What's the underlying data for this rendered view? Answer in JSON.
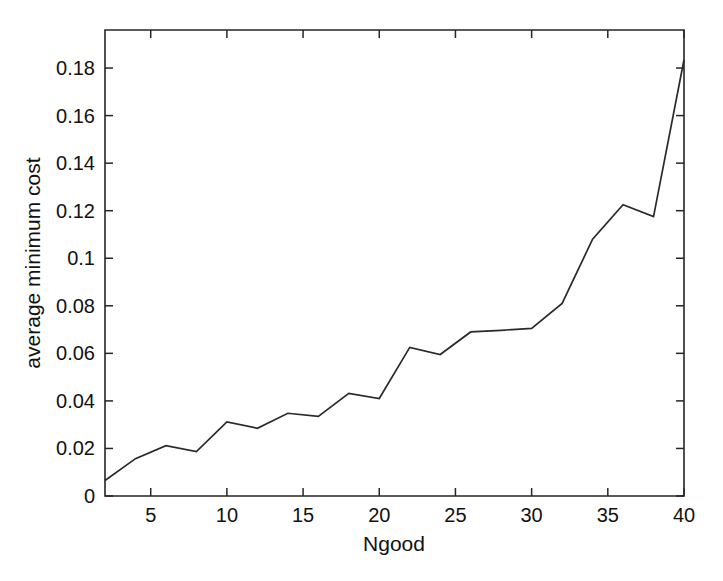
{
  "figure": {
    "background_color": "#ffffff",
    "line_color": "#2a2a2a",
    "axis_color": "#262626",
    "title": ""
  },
  "chart_data": {
    "type": "line",
    "title": "",
    "xlabel": "Ngood",
    "ylabel": "average minimum cost",
    "xlim": [
      2,
      40
    ],
    "ylim": [
      0,
      0.196
    ],
    "grid": false,
    "legend": null,
    "x_ticks": [
      5,
      10,
      15,
      20,
      25,
      30,
      35,
      40
    ],
    "x_tick_labels": [
      "5",
      "10",
      "15",
      "20",
      "25",
      "30",
      "35",
      "40"
    ],
    "y_ticks": [
      0,
      0.02,
      0.04,
      0.06,
      0.08,
      0.1,
      0.12,
      0.14,
      0.16,
      0.18
    ],
    "y_tick_labels": [
      "0",
      "0.02",
      "0.04",
      "0.06",
      "0.08",
      "0.1",
      "0.12",
      "0.14",
      "0.16",
      "0.18"
    ],
    "x": [
      2,
      4,
      6,
      8,
      10,
      12,
      14,
      16,
      18,
      20,
      22,
      24,
      26,
      28,
      30,
      32,
      34,
      36,
      38,
      40
    ],
    "values": [
      0.0065,
      0.0157,
      0.0212,
      0.0187,
      0.0312,
      0.0285,
      0.0348,
      0.0335,
      0.0432,
      0.041,
      0.0625,
      0.0595,
      0.069,
      0.0697,
      0.0705,
      0.081,
      0.108,
      0.1225,
      0.1175,
      0.1835
    ],
    "series": [
      {
        "name": "average minimum cost",
        "values": [
          0.0065,
          0.0157,
          0.0212,
          0.0187,
          0.0312,
          0.0285,
          0.0348,
          0.0335,
          0.0432,
          0.041,
          0.0625,
          0.0595,
          0.069,
          0.0697,
          0.0705,
          0.081,
          0.108,
          0.1225,
          0.1175,
          0.1835
        ]
      }
    ]
  }
}
